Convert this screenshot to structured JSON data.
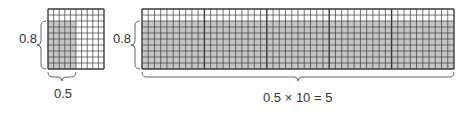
{
  "colors": {
    "shade": "#c6c6c6",
    "grid_line": "#3a3a3a",
    "background": "#ffffff",
    "text": "#333333"
  },
  "small_grid": {
    "rows": 10,
    "cols": 10,
    "shaded_rows": 8,
    "shaded_cols": 5,
    "x": 48,
    "y": 9,
    "width": 56,
    "height": 60,
    "height_label": "0.8",
    "width_label": "0.5"
  },
  "large_grid": {
    "blocks": 5,
    "rows": 10,
    "cols_per_block": 10,
    "shaded_rows": 8,
    "x": 142,
    "y": 9,
    "width": 312,
    "height": 60,
    "height_label": "0.8",
    "width_label": "0.5 × 10 = 5"
  }
}
